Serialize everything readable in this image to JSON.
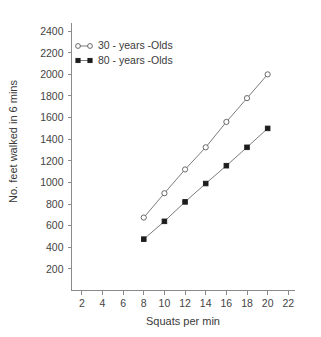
{
  "chart_data": {
    "type": "line",
    "title": "",
    "subtitle": "",
    "xlabel": "Squats per min",
    "ylabel": "No. feet walked in 6 mins",
    "xlim": [
      1,
      22.6
    ],
    "ylim": [
      0,
      2480
    ],
    "xticks": [
      2,
      4,
      6,
      8,
      10,
      12,
      14,
      16,
      18,
      20,
      22
    ],
    "yticks": [
      200,
      400,
      600,
      800,
      1000,
      1200,
      1400,
      1600,
      1800,
      2000,
      2200,
      2400
    ],
    "xticklabels": [
      "2",
      "4",
      "6",
      "8",
      "10",
      "12",
      "14",
      "16",
      "18",
      "20",
      "22"
    ],
    "yticklabels": [
      "200",
      "400",
      "600",
      "800",
      "1000",
      "1200",
      "1400",
      "1600",
      "1800",
      "2000",
      "2200",
      "2400"
    ],
    "grid": false,
    "legend_position": "upper left",
    "x": [
      8,
      10,
      12,
      14,
      16,
      18,
      20
    ],
    "series": [
      {
        "name": "30 - years -Olds",
        "marker": "open-circle",
        "values": [
          675,
          900,
          1120,
          1325,
          1560,
          1780,
          2000
        ]
      },
      {
        "name": "80 - years -Olds",
        "marker": "filled-square",
        "values": [
          475,
          640,
          820,
          990,
          1155,
          1325,
          1500
        ]
      }
    ],
    "colors": {
      "axis": "#8a8a8a",
      "line": "#6d6d6d",
      "marker_open_fill": "#ffffff",
      "marker_open_stroke": "#595959",
      "marker_filled": "#1c1c1c",
      "text": "#3a3a3a"
    }
  },
  "legend": {
    "entries": [
      {
        "label": "30 - years -Olds"
      },
      {
        "label": "80 - years -Olds"
      }
    ]
  },
  "axes": {
    "x_title": "Squats per min",
    "y_title": "No. feet walked in 6 mins"
  }
}
